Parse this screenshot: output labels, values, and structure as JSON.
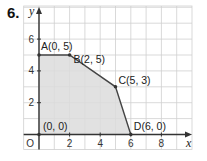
{
  "problem": {
    "number": "6."
  },
  "chart_data": {
    "type": "scatter",
    "title": "",
    "xlabel": "x",
    "ylabel": "y",
    "xlim": [
      -1,
      10
    ],
    "ylim": [
      -1,
      8
    ],
    "grid": true,
    "x_ticks": [
      {
        "v": 2,
        "label": "2"
      },
      {
        "v": 4,
        "label": "4"
      },
      {
        "v": 6,
        "label": "6"
      },
      {
        "v": 8,
        "label": "8"
      }
    ],
    "y_ticks": [
      {
        "v": 2,
        "label": "2"
      },
      {
        "v": 4,
        "label": "4"
      },
      {
        "v": 6,
        "label": "6"
      }
    ],
    "origin_label": "O",
    "feasible_region": {
      "fill": "#dcdcdc",
      "stroke": "#444444",
      "vertices": [
        [
          0,
          0
        ],
        [
          0,
          5
        ],
        [
          2,
          5
        ],
        [
          5,
          3
        ],
        [
          6,
          0
        ]
      ]
    },
    "points": [
      {
        "name": "origin",
        "label": "(0, 0)",
        "x": 0,
        "y": 0,
        "dx": 4,
        "dy": -5
      },
      {
        "name": "A",
        "label": "A(0, 5)",
        "x": 0,
        "y": 5,
        "dx": 2,
        "dy": -5
      },
      {
        "name": "B",
        "label": "B(2, 5)",
        "x": 2,
        "y": 5,
        "dx": 4,
        "dy": 8
      },
      {
        "name": "C",
        "label": "C(5, 3)",
        "x": 5,
        "y": 3,
        "dx": 3,
        "dy": -3
      },
      {
        "name": "D",
        "label": "D(6, 0)",
        "x": 6,
        "y": 0,
        "dx": 3,
        "dy": -5
      }
    ]
  },
  "colors": {
    "grid": "#cfcfcf",
    "axis": "#333333",
    "region": "#dcdcdc",
    "edge": "#444444"
  }
}
